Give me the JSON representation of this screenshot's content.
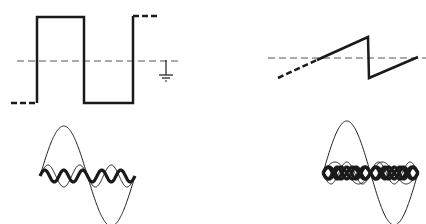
{
  "figure": {
    "panels": [
      {
        "id": "square-wave",
        "description": "Square wave with dashed zero-reference line and ground symbol",
        "reference_line": {
          "y": 61,
          "x1": 17,
          "x2": 179
        },
        "waveform_points": [
          [
            17,
            103
          ],
          [
            37,
            103
          ],
          [
            37,
            17
          ],
          [
            84,
            17
          ],
          [
            84,
            103
          ],
          [
            133,
            103
          ],
          [
            133,
            16
          ],
          [
            157,
            16
          ]
        ],
        "ground_symbol": {
          "x": 166,
          "y_top": 60,
          "y_bottom": 76
        }
      },
      {
        "id": "sawtooth-wave",
        "description": "Sawtooth wave with dashed zero-reference line",
        "reference_line": {
          "y": 58,
          "x1": 268,
          "x2": 426
        },
        "waveform_points": [
          [
            278,
            78
          ],
          [
            368,
            37
          ],
          [
            369,
            78
          ],
          [
            418,
            57
          ]
        ],
        "dashed_segment_end_x": 317
      },
      {
        "id": "square-harmonics",
        "description": "Fundamental plus 3rd and 5th harmonics (odd harmonics) of square wave",
        "x_start": 40,
        "x_end": 135,
        "center_y": 176,
        "harmonics": [
          {
            "order": 1,
            "amplitude": 50,
            "stroke": "thin"
          },
          {
            "order": 3,
            "amplitude": 11,
            "stroke": "thin"
          },
          {
            "order": 5,
            "amplitude": 6,
            "stroke": "bold"
          }
        ]
      },
      {
        "id": "sawtooth-harmonics",
        "description": "Fundamental plus 2nd, 3rd, 4th, 5th harmonics of sawtooth wave",
        "x_start": 323,
        "x_end": 418,
        "center_y": 173,
        "harmonics": [
          {
            "order": 1,
            "amplitude": 52,
            "stroke": "thin"
          },
          {
            "order": 2,
            "amplitude": 11,
            "stroke": "thin"
          },
          {
            "order": 3,
            "amplitude": 11,
            "stroke": "thin"
          },
          {
            "order": 4,
            "amplitude": 6,
            "stroke": "bold"
          },
          {
            "order": 5,
            "amplitude": 6,
            "stroke": "bold"
          }
        ]
      }
    ],
    "colors": {
      "ink": "#1a1a1a",
      "reference": "#555555",
      "background": "#ffffff"
    }
  }
}
